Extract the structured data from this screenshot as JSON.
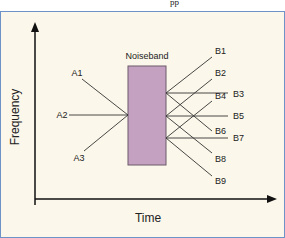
{
  "header_fragment": "pp",
  "diagram": {
    "y_axis_label": "Frequency",
    "x_axis_label": "Time",
    "noiseband_label": "Noiseband",
    "colors": {
      "background": "#fbf7ea",
      "border": "#6e93c9",
      "noiseband_fill": "#c4a1c1",
      "noiseband_stroke": "#6b5a6b",
      "line": "#333333"
    },
    "incoming": [
      {
        "label": "A1"
      },
      {
        "label": "A2"
      },
      {
        "label": "A3"
      }
    ],
    "outgoing": [
      {
        "label": "B1"
      },
      {
        "label": "B2"
      },
      {
        "label": "B3"
      },
      {
        "label": "B4"
      },
      {
        "label": "B5"
      },
      {
        "label": "B6"
      },
      {
        "label": "B7"
      },
      {
        "label": "B8"
      },
      {
        "label": "B9"
      }
    ]
  }
}
